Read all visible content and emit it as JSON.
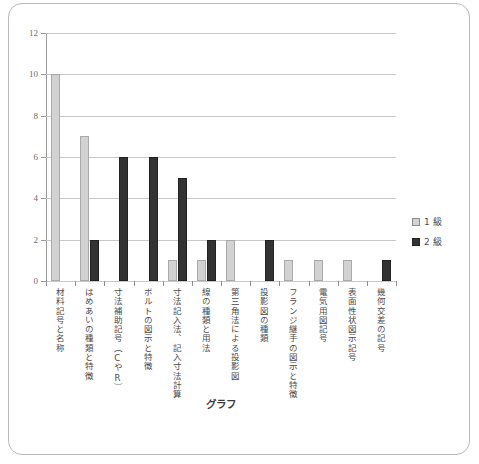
{
  "chart_data": {
    "type": "bar",
    "title": "グラフ",
    "xlabel": "",
    "ylabel": "",
    "ylim": [
      0,
      12
    ],
    "ytick_values": [
      12,
      10,
      8,
      6,
      4,
      2,
      0
    ],
    "grid": true,
    "legend_position": "right",
    "categories": [
      "材料記号と名称",
      "はめあいの種類と特徴",
      "寸法補助記号（CやR）",
      "ボルトの図示と特徴",
      "寸法記入法、記入寸法計算",
      "線の種類と用法",
      "第三角法による投影図",
      "投影図の種類",
      "フランジ継手の図示と特徴",
      "電気用図記号",
      "表面性状図示記号",
      "幾何交差の記号"
    ],
    "series": [
      {
        "name": "1 級",
        "color": "#d2d2d2",
        "values": [
          10,
          7,
          0,
          0,
          1,
          1,
          2,
          0,
          1,
          1,
          1,
          0
        ]
      },
      {
        "name": "2 級",
        "color": "#333333",
        "values": [
          0,
          2,
          6,
          6,
          5,
          2,
          0,
          2,
          0,
          0,
          0,
          1
        ]
      }
    ]
  },
  "legend": {
    "items": [
      {
        "label": "1 級",
        "swatch": "light-gray-square"
      },
      {
        "label": "2 級",
        "swatch": "dark-square"
      }
    ]
  }
}
